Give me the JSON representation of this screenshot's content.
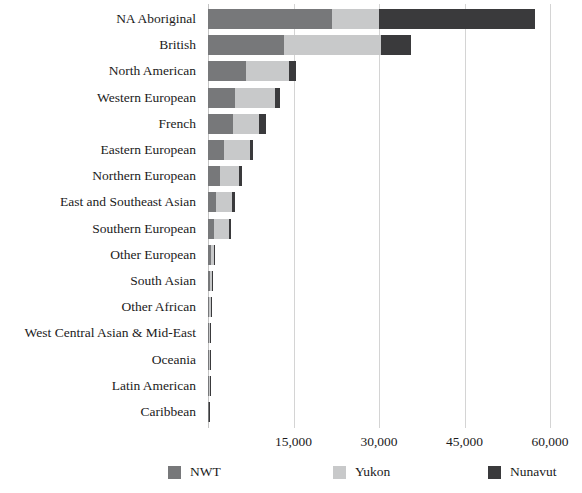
{
  "chart_data": {
    "type": "bar",
    "orientation": "horizontal",
    "stacked": true,
    "title": "",
    "subtitle": "",
    "xlabel": "",
    "ylabel": "",
    "xlim": [
      0,
      60000
    ],
    "ylim": null,
    "grid": true,
    "grid_axis": "x",
    "legend_position": "bottom",
    "xticks": [
      0,
      15000,
      30000,
      45000,
      60000
    ],
    "xtick_labels": [
      "",
      "15,000",
      "30,000",
      "45,000",
      "60,000"
    ],
    "categories": [
      "NA Aboriginal",
      "British",
      "North American",
      "Western European",
      "French",
      "Eastern European",
      "Northern European",
      "East and Southeast Asian",
      "Southern European",
      "Other European",
      "South Asian",
      "Other African",
      "West Central Asian & Mid-East",
      "Oceania",
      "Latin American",
      "Caribbean"
    ],
    "series": [
      {
        "name": "NWT",
        "color": "#77787a",
        "values": [
          21800,
          13300,
          6700,
          4700,
          4400,
          2800,
          2100,
          1400,
          1100,
          450,
          330,
          260,
          220,
          150,
          130,
          90
        ]
      },
      {
        "name": "Yukon",
        "color": "#c8c9ca",
        "values": [
          8200,
          17000,
          7500,
          7000,
          4600,
          4600,
          3300,
          2800,
          2500,
          650,
          400,
          230,
          200,
          140,
          170,
          70
        ]
      },
      {
        "name": "Nunavut",
        "color": "#3a3a3c",
        "values": [
          27400,
          5400,
          1200,
          900,
          1200,
          500,
          500,
          500,
          500,
          150,
          100,
          90,
          90,
          60,
          50,
          40
        ]
      }
    ],
    "totals": [
      57400,
      35700,
      15400,
      12600,
      10200,
      7900,
      5900,
      4700,
      4100,
      1250,
      830,
      580,
      510,
      350,
      350,
      200
    ]
  },
  "legend": {
    "items": [
      {
        "label": "NWT",
        "color": "#77787a"
      },
      {
        "label": "Yukon",
        "color": "#c8c9ca"
      },
      {
        "label": "Nunavut",
        "color": "#3a3a3c"
      }
    ]
  },
  "colors": {
    "background": "#ffffff",
    "text": "#1b1b1b",
    "gridline": "#d4d4d4",
    "nwt": "#77787a",
    "yukon": "#c8c9ca",
    "nunavut": "#3a3a3c"
  }
}
